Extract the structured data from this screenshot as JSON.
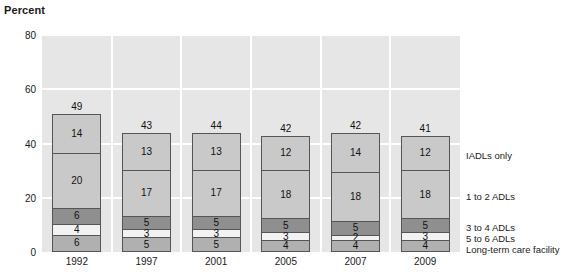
{
  "chart_data": {
    "type": "bar",
    "title": "",
    "subtitle": "",
    "xlabel": "",
    "ylabel": "Percent",
    "ylim": [
      0,
      80
    ],
    "yticks": [
      0,
      20,
      40,
      60,
      80
    ],
    "grid": true,
    "stacked": true,
    "legend_position": "right",
    "categories": [
      "1992",
      "1997",
      "2001",
      "2005",
      "2007",
      "2009"
    ],
    "totals": [
      49,
      43,
      44,
      42,
      42,
      41
    ],
    "series": [
      {
        "name": "Long-term care facility",
        "color": "#b0b0b0",
        "values": [
          6,
          5,
          5,
          4,
          4,
          4
        ]
      },
      {
        "name": "5 to 6 ADLs",
        "color": "#f2f2f2",
        "values": [
          4,
          3,
          3,
          3,
          2,
          3
        ]
      },
      {
        "name": "3 to 4 ADLs",
        "color": "#8f8f8f",
        "values": [
          6,
          5,
          5,
          5,
          5,
          5
        ]
      },
      {
        "name": "1 to 2 ADLs",
        "color": "#c9c9c9",
        "values": [
          20,
          17,
          17,
          18,
          18,
          18
        ]
      },
      {
        "name": "IADLs only",
        "color": "#c9c9c9",
        "values": [
          14,
          13,
          13,
          12,
          14,
          12
        ]
      }
    ]
  },
  "legend": {
    "items": [
      {
        "label": "IADLs only"
      },
      {
        "label": "1 to 2 ADLs"
      },
      {
        "label": "3 to 4 ADLs"
      },
      {
        "label": "5 to 6 ADLs"
      },
      {
        "label": "Long-term care facility"
      }
    ]
  }
}
